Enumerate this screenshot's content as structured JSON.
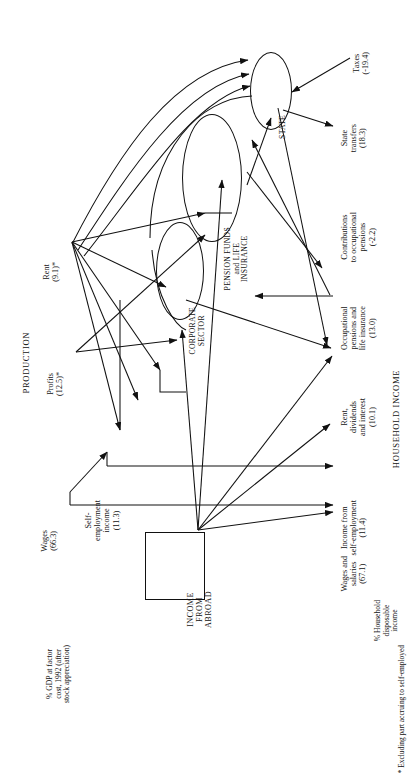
{
  "figure": {
    "orientation": "rotated-90-ccw",
    "sections": {
      "production": "PRODUCTION",
      "household_income": "HOUSEHOLD INCOME"
    },
    "footnote": "*  Excluding part accruing to self-employed"
  },
  "axis_notes": {
    "gdp_note": [
      "% GDP at factor",
      "cost, 1992 (after",
      "stock appreciation)"
    ],
    "hdi_note": [
      "% Household",
      "disposable",
      "income"
    ]
  },
  "production_items": [
    {
      "id": "wages",
      "label": [
        "Wages"
      ],
      "value": "(66.3)"
    },
    {
      "id": "self",
      "label": [
        "Self-",
        "employment",
        "income"
      ],
      "value": "(11.3)"
    },
    {
      "id": "profits",
      "label": [
        "Profits"
      ],
      "value": "(12.5)*"
    },
    {
      "id": "rent",
      "label": [
        "Rent"
      ],
      "value": "(9.1)*"
    }
  ],
  "institutions": [
    {
      "id": "corporate",
      "label": [
        "CORPORATE",
        "SECTOR"
      ],
      "shape": "ellipse"
    },
    {
      "id": "pension",
      "label": [
        "PENSION FUNDS",
        "and LIFE",
        "INSURANCE"
      ],
      "shape": "ellipse"
    },
    {
      "id": "state",
      "label": [
        "STATE"
      ],
      "shape": "ellipse"
    },
    {
      "id": "abroad",
      "label": [
        "INCOME",
        "FROM",
        "ABROAD"
      ],
      "shape": "rectangle"
    }
  ],
  "household_items": [
    {
      "id": "wages_salaries",
      "label": [
        "Wages and",
        "salaries"
      ],
      "value": "(67.1)"
    },
    {
      "id": "income_self",
      "label": [
        "Income from",
        "self-employment"
      ],
      "value": "(11.4)"
    },
    {
      "id": "rent_div_int",
      "label": [
        "Rent,",
        "dividends",
        "and interest"
      ],
      "value": "(10.1)"
    },
    {
      "id": "occ_pensions",
      "label": [
        "Occupational",
        "pensions and",
        "life insurance"
      ],
      "value": "(13.0)"
    },
    {
      "id": "contributions",
      "label": [
        "Contributions",
        "to occupational",
        "pensions"
      ],
      "value": "(-2.2)"
    },
    {
      "id": "state_transfers",
      "label": [
        "State",
        "transfers"
      ],
      "value": "(18.3)"
    },
    {
      "id": "taxes",
      "label": [
        "Taxes"
      ],
      "value": "(-19.4)"
    }
  ],
  "style": {
    "ink": "#111111",
    "paper": "#ffffff"
  }
}
